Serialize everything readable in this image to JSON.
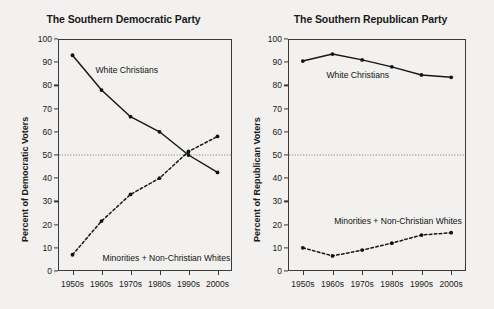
{
  "figure": {
    "background_color": "#f2f1ef",
    "axis_color": "#3a3a3a",
    "line_color": "#171717",
    "refline_color": "#8c8c8c"
  },
  "chart_data": [
    {
      "type": "line",
      "title": "The Southern Democratic Party",
      "xlabel": "",
      "ylabel": "Percent of Democratic Voters",
      "categories": [
        "1950s",
        "1960s",
        "1970s",
        "1980s",
        "1990s",
        "2000s"
      ],
      "ylim": [
        0,
        100
      ],
      "yticks": [
        0,
        10,
        20,
        30,
        40,
        50,
        60,
        70,
        80,
        90,
        100
      ],
      "grid": false,
      "legend_position": "inline-annotations",
      "reference_line": 50,
      "series": [
        {
          "name": "White Christians",
          "style": "solid",
          "values": [
            93,
            78,
            66.5,
            60,
            50,
            42.5
          ],
          "label_x": "1960s",
          "label_y": 86
        },
        {
          "name": "Minorities + Non-Christian Whites",
          "style": "dashed",
          "values": [
            7,
            21.5,
            33,
            40,
            51.5,
            58
          ],
          "label_x": "1970s",
          "label_y": 5
        }
      ]
    },
    {
      "type": "line",
      "title": "The Southern Republican Party",
      "xlabel": "",
      "ylabel": "Percent of Republican Voters",
      "categories": [
        "1950s",
        "1960s",
        "1970s",
        "1980s",
        "1990s",
        "2000s"
      ],
      "ylim": [
        0,
        100
      ],
      "yticks": [
        0,
        10,
        20,
        30,
        40,
        50,
        60,
        70,
        80,
        90,
        100
      ],
      "grid": false,
      "legend_position": "inline-annotations",
      "reference_line": 50,
      "series": [
        {
          "name": "White Christians",
          "style": "solid",
          "values": [
            90.5,
            93.5,
            91,
            88,
            84.5,
            83.5
          ],
          "label_x": "1960s",
          "label_y": 84
        },
        {
          "name": "Minorities + Non-Christian Whites",
          "style": "dashed",
          "values": [
            10,
            6.5,
            9,
            12,
            15.5,
            16.5
          ],
          "label_x": "1970s",
          "label_y": 21
        }
      ]
    }
  ]
}
